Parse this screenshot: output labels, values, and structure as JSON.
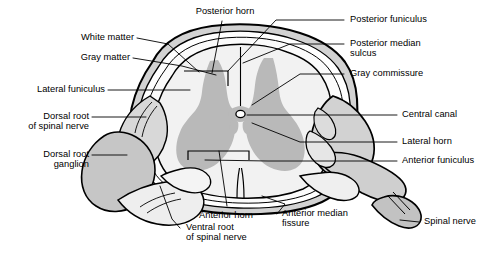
{
  "figure": {
    "colors": {
      "background": "#ffffff",
      "outline": "#000000",
      "gray_matter": "#b9b9b9",
      "white_matter": "#f2f2f2",
      "dura_mater": "#d0d0d0",
      "ganglion": "#c6c6c6",
      "nerve_light": "#ececec",
      "leader_line": "#000000"
    }
  },
  "labels": {
    "posterior_horn": "Posterior horn",
    "posterior_funiculus": "Posterior funiculus",
    "posterior_median_sulcus_1": "Posterior median",
    "posterior_median_sulcus_2": "sulcus",
    "gray_commissure": "Gray commissure",
    "white_matter": "White matter",
    "gray_matter": "Gray matter",
    "lateral_funiculus": "Lateral funiculus",
    "dorsal_root_1": "Dorsal root",
    "dorsal_root_2": "of spinal nerve",
    "dorsal_root_ganglion_1": "Dorsal root",
    "dorsal_root_ganglion_2": "ganglion",
    "central_canal": "Central canal",
    "lateral_horn": "Lateral horn",
    "anterior_funiculus": "Anterior funiculus",
    "anterior_horn": "Anterior horn",
    "anterior_median_fissure_1": "Anterior median",
    "anterior_median_fissure_2": "fissure",
    "ventral_root_1": "Ventral root",
    "ventral_root_2": "of spinal nerve",
    "spinal_nerve": "Spinal nerve"
  }
}
